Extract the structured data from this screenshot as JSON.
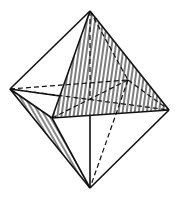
{
  "figure": {
    "background": "#ffffff",
    "stroke": "#111111",
    "vertices": {
      "top": [
        90,
        11
      ],
      "left": [
        10,
        89
      ],
      "right": [
        169,
        110
      ],
      "front": [
        52,
        118
      ],
      "back": [
        128,
        80
      ],
      "center": [
        90,
        100
      ],
      "bottom": [
        90,
        188
      ]
    },
    "hatched_faces": [
      "top-front-right",
      "left-front-bottom"
    ]
  }
}
